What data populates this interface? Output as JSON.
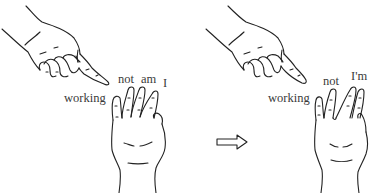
{
  "figure": {
    "left_panel": {
      "labels": {
        "working": "working",
        "not": "not",
        "am": "am",
        "i": "I"
      }
    },
    "arrow": {
      "symbol": "double-arrow-right-icon"
    },
    "right_panel": {
      "labels": {
        "working": "working",
        "not": "not",
        "im": "I'm"
      }
    }
  },
  "colors": {
    "ink": "#222222",
    "label": "#3a3a3a",
    "background": "#ffffff"
  }
}
